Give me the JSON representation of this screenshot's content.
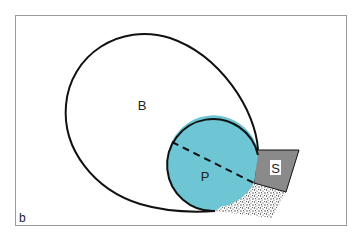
{
  "figure": {
    "panel_label": "b",
    "colors": {
      "frame": "#9a9a9a",
      "outline": "#111111",
      "region_p_fill": "#6ec6d4",
      "region_s_fill": "#8a8a8a",
      "stipple_dot": "#333333",
      "background": "#ffffff"
    }
  },
  "regions": {
    "b": {
      "label": "B"
    },
    "p": {
      "label": "P"
    },
    "s": {
      "label": "S"
    }
  }
}
